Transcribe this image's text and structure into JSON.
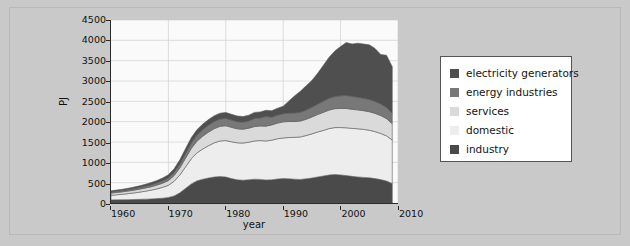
{
  "chart_data": {
    "type": "area",
    "stacked": true,
    "title": "",
    "xlabel": "year",
    "ylabel": "PJ",
    "xlim": [
      1960,
      2010
    ],
    "ylim": [
      0,
      4500
    ],
    "grid": true,
    "legend_position": "right",
    "xticks": [
      1960,
      1970,
      1980,
      1990,
      2000,
      2010
    ],
    "yticks": [
      0,
      500,
      1000,
      1500,
      2000,
      2500,
      3000,
      3500,
      4000,
      4500
    ],
    "x": [
      1960,
      1961,
      1962,
      1963,
      1964,
      1965,
      1966,
      1967,
      1968,
      1969,
      1970,
      1971,
      1972,
      1973,
      1974,
      1975,
      1976,
      1977,
      1978,
      1979,
      1980,
      1981,
      1982,
      1983,
      1984,
      1985,
      1986,
      1987,
      1988,
      1989,
      1990,
      1991,
      1992,
      1993,
      1994,
      1995,
      1996,
      1997,
      1998,
      1999,
      2000,
      2001,
      2002,
      2003,
      2004,
      2005,
      2006,
      2007,
      2008,
      2009
    ],
    "series": [
      {
        "name": "industry",
        "color": "#4a4a4a",
        "values": [
          75,
          78,
          80,
          83,
          86,
          90,
          95,
          100,
          108,
          118,
          135,
          175,
          250,
          360,
          470,
          545,
          585,
          615,
          640,
          650,
          640,
          600,
          570,
          560,
          570,
          585,
          580,
          565,
          570,
          590,
          600,
          595,
          585,
          580,
          595,
          615,
          640,
          665,
          690,
          700,
          690,
          675,
          655,
          640,
          630,
          620,
          600,
          575,
          540,
          480
        ]
      },
      {
        "name": "domestic",
        "color": "#ededed",
        "values": [
          115,
          125,
          135,
          148,
          162,
          178,
          196,
          216,
          240,
          268,
          300,
          360,
          440,
          530,
          620,
          690,
          745,
          795,
          840,
          875,
          895,
          905,
          910,
          915,
          925,
          940,
          955,
          960,
          975,
          990,
          1000,
          1015,
          1030,
          1045,
          1065,
          1085,
          1105,
          1120,
          1140,
          1155,
          1165,
          1175,
          1180,
          1185,
          1180,
          1170,
          1155,
          1135,
          1110,
          1070
        ]
      },
      {
        "name": "services",
        "color": "#dadada",
        "values": [
          55,
          57,
          60,
          64,
          68,
          73,
          78,
          84,
          92,
          102,
          115,
          140,
          175,
          215,
          255,
          290,
          315,
          335,
          350,
          360,
          365,
          355,
          345,
          340,
          345,
          355,
          360,
          365,
          375,
          385,
          395,
          395,
          390,
          390,
          400,
          415,
          430,
          445,
          455,
          465,
          470,
          475,
          470,
          465,
          460,
          455,
          450,
          440,
          425,
          400
        ]
      },
      {
        "name": "energy industries",
        "color": "#787878",
        "values": [
          30,
          31,
          33,
          35,
          38,
          41,
          44,
          48,
          53,
          59,
          66,
          78,
          95,
          115,
          135,
          150,
          160,
          168,
          175,
          178,
          180,
          178,
          175,
          173,
          178,
          200,
          195,
          235,
          190,
          195,
          200,
          205,
          210,
          215,
          225,
          240,
          255,
          275,
          290,
          300,
          310,
          320,
          315,
          310,
          305,
          300,
          295,
          285,
          275,
          255
        ]
      },
      {
        "name": "electricity generators",
        "color": "#4f4f4f",
        "values": [
          25,
          27,
          30,
          33,
          37,
          42,
          47,
          53,
          60,
          68,
          78,
          90,
          105,
          118,
          128,
          133,
          137,
          140,
          143,
          145,
          147,
          143,
          140,
          138,
          142,
          148,
          150,
          155,
          160,
          170,
          185,
          300,
          420,
          520,
          600,
          660,
          760,
          880,
          1010,
          1120,
          1215,
          1300,
          1290,
          1330,
          1335,
          1345,
          1300,
          1215,
          1285,
          1145
        ]
      }
    ],
    "peak_total": 4050,
    "peak_year": 2005
  },
  "legend": {
    "items": [
      {
        "label": "electricity generators",
        "color": "#4f4f4f"
      },
      {
        "label": "energy industries",
        "color": "#787878"
      },
      {
        "label": "services",
        "color": "#dadada"
      },
      {
        "label": "domestic",
        "color": "#ededed"
      },
      {
        "label": "industry",
        "color": "#4a4a4a"
      }
    ]
  },
  "colors": {
    "page_background": "#c9c9c9",
    "plot_background": "#fafafa",
    "axis": "#2a2a2a",
    "grid": "#cfcfcf",
    "legend_border": "#555555"
  }
}
